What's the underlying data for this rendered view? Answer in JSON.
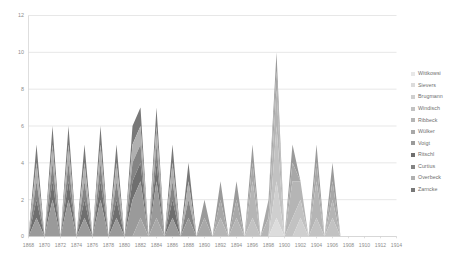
{
  "chart_data": {
    "type": "area",
    "stacked": true,
    "title": "",
    "xlabel": "",
    "ylabel": "",
    "ylim": [
      0,
      12
    ],
    "ytick_values": [
      0,
      2,
      4,
      6,
      8,
      10,
      12
    ],
    "xlim": [
      1868,
      1914
    ],
    "grid": true,
    "legend_position": "right",
    "x": [
      1868,
      1869,
      1870,
      1871,
      1872,
      1873,
      1874,
      1875,
      1876,
      1877,
      1878,
      1879,
      1880,
      1881,
      1882,
      1883,
      1884,
      1885,
      1886,
      1887,
      1888,
      1889,
      1890,
      1891,
      1892,
      1893,
      1894,
      1895,
      1896,
      1897,
      1898,
      1899,
      1900,
      1901,
      1902,
      1903,
      1904,
      1905,
      1906,
      1907,
      1908,
      1909,
      1910,
      1911,
      1912,
      1913,
      1914
    ],
    "xtick_labels": [
      "1868",
      "1870",
      "1872",
      "1874",
      "1876",
      "1878",
      "1880",
      "1882",
      "1884",
      "1886",
      "1888",
      "1890",
      "1892",
      "1894",
      "1896",
      "1898",
      "1900",
      "1902",
      "1904",
      "1906",
      "1908",
      "1910",
      "1912",
      "1914"
    ],
    "series": [
      {
        "name": "Wittkowsi",
        "color": "#e8e8e8",
        "values": [
          0,
          0,
          0,
          0,
          0,
          0,
          0,
          0,
          0,
          0,
          0,
          0,
          0,
          0,
          0,
          0,
          0,
          0,
          0,
          0,
          0,
          0,
          0,
          0,
          0,
          0,
          0,
          0,
          0,
          0,
          0,
          0,
          0,
          0,
          0,
          0,
          0,
          0,
          0,
          0,
          0,
          0,
          0,
          0,
          0,
          0,
          0
        ]
      },
      {
        "name": "Sievers",
        "color": "#dcdcdc",
        "values": [
          0,
          0,
          0,
          0,
          0,
          0,
          0,
          0,
          0,
          0,
          0,
          0,
          0,
          0,
          0,
          0,
          0,
          0,
          0,
          0,
          0,
          0,
          0,
          0,
          0,
          0,
          0,
          0,
          0,
          0,
          0,
          1,
          0,
          0,
          0,
          0,
          0,
          0,
          0,
          0,
          0,
          0,
          0,
          0,
          0,
          0,
          0
        ]
      },
      {
        "name": "Brugmann",
        "color": "#cfcfcf",
        "values": [
          0,
          0,
          0,
          0,
          0,
          0,
          0,
          0,
          0,
          0,
          0,
          0,
          0,
          0,
          0,
          0,
          0,
          0,
          0,
          0,
          0,
          0,
          0,
          0,
          0,
          0,
          0,
          0,
          0,
          0,
          0,
          2,
          0,
          0,
          1,
          0,
          0,
          0,
          0,
          0,
          0,
          0,
          0,
          0,
          0,
          0,
          0
        ]
      },
      {
        "name": "Windisch",
        "color": "#c2c2c2",
        "values": [
          0,
          0,
          0,
          0,
          0,
          0,
          0,
          0,
          0,
          0,
          0,
          0,
          0,
          0,
          0,
          0,
          0,
          0,
          0,
          0,
          0,
          0,
          0,
          0,
          0,
          0,
          0,
          0,
          1,
          0,
          0,
          3,
          0,
          1,
          1,
          0,
          1,
          0,
          1,
          0,
          0,
          0,
          0,
          0,
          0,
          0,
          0
        ]
      },
      {
        "name": "Ribbeck",
        "color": "#b5b5b5",
        "values": [
          0,
          0,
          0,
          0,
          0,
          0,
          0,
          0,
          0,
          0,
          0,
          0,
          0,
          0,
          0,
          0,
          0,
          0,
          0,
          0,
          0,
          0,
          0,
          0,
          1,
          0,
          1,
          0,
          2,
          0,
          1,
          2,
          0,
          2,
          1,
          0,
          2,
          0,
          1,
          0,
          0,
          0,
          0,
          0,
          0,
          0,
          0
        ]
      },
      {
        "name": "Wülker",
        "color": "#a8a8a8",
        "values": [
          0,
          0,
          0,
          0,
          0,
          0,
          0,
          0,
          0,
          0,
          0,
          0,
          0,
          0,
          1,
          0,
          1,
          0,
          0,
          0,
          0,
          0,
          1,
          0,
          1,
          0,
          1,
          0,
          1,
          0,
          1,
          1,
          0,
          1,
          0,
          0,
          1,
          0,
          1,
          0,
          0,
          0,
          0,
          0,
          0,
          0,
          0
        ]
      },
      {
        "name": "Voigt",
        "color": "#9a9a9a",
        "values": [
          0,
          1,
          0,
          2,
          0,
          2,
          0,
          1,
          0,
          2,
          0,
          1,
          0,
          2,
          2,
          0,
          2,
          0,
          1,
          0,
          1,
          0,
          1,
          0,
          1,
          0,
          1,
          0,
          1,
          0,
          0,
          1,
          0,
          1,
          0,
          0,
          1,
          0,
          1,
          0,
          0,
          0,
          0,
          0,
          0,
          0,
          0
        ]
      },
      {
        "name": "Ritschl",
        "color": "#6f6f6f",
        "values": [
          0,
          1,
          0,
          1,
          0,
          1,
          0,
          1,
          0,
          1,
          0,
          1,
          0,
          1,
          1,
          0,
          1,
          0,
          1,
          0,
          0,
          0,
          0,
          0,
          0,
          0,
          0,
          0,
          0,
          0,
          0,
          0,
          0,
          0,
          0,
          0,
          0,
          0,
          0,
          0,
          0,
          0,
          0,
          0,
          0,
          0,
          0
        ]
      },
      {
        "name": "Curtius",
        "color": "#848484",
        "values": [
          0,
          1,
          0,
          1,
          0,
          1,
          0,
          1,
          0,
          1,
          0,
          1,
          0,
          1,
          1,
          0,
          1,
          0,
          1,
          0,
          1,
          0,
          0,
          0,
          0,
          0,
          0,
          0,
          0,
          0,
          0,
          0,
          0,
          0,
          0,
          0,
          0,
          0,
          0,
          0,
          0,
          0,
          0,
          0,
          0,
          0,
          0
        ]
      },
      {
        "name": "Overbeck",
        "color": "#b0b0b0",
        "values": [
          0,
          1,
          0,
          1,
          0,
          1,
          0,
          1,
          0,
          1,
          0,
          1,
          0,
          1,
          1,
          0,
          1,
          0,
          1,
          0,
          1,
          0,
          0,
          0,
          0,
          0,
          0,
          0,
          0,
          0,
          0,
          0,
          0,
          0,
          0,
          0,
          0,
          0,
          0,
          0,
          0,
          0,
          0,
          0,
          0,
          0,
          0
        ]
      },
      {
        "name": "Zarncke",
        "color": "#787878",
        "values": [
          0,
          1,
          0,
          1,
          0,
          1,
          0,
          1,
          0,
          1,
          0,
          1,
          0,
          1,
          1,
          0,
          1,
          0,
          1,
          0,
          1,
          0,
          0,
          0,
          0,
          0,
          0,
          0,
          0,
          0,
          0,
          0,
          0,
          0,
          0,
          0,
          0,
          0,
          0,
          0,
          0,
          0,
          0,
          0,
          0,
          0,
          0
        ]
      }
    ],
    "totals": [
      0,
      5,
      0,
      7,
      0,
      7,
      0,
      6,
      0,
      7,
      0,
      6,
      0,
      6,
      6,
      0,
      6,
      0,
      4,
      0,
      3,
      0,
      2,
      0,
      3,
      0,
      3,
      0,
      5,
      0,
      2,
      10,
      0,
      5,
      3,
      0,
      5,
      0,
      4,
      0,
      0,
      0,
      0,
      0,
      0,
      0,
      0
    ]
  }
}
